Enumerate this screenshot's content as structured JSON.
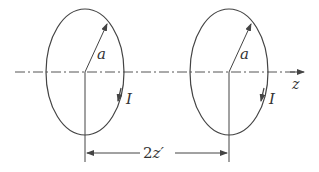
{
  "diagram": {
    "type": "coaxial current loops",
    "loops": [
      {
        "id": "left",
        "radius_label": "a",
        "current_label": "I"
      },
      {
        "id": "right",
        "radius_label": "a",
        "current_label": "I"
      }
    ],
    "axis_label": "z",
    "separation_label": "2z′",
    "separation_prefix": "2",
    "separation_var": "z′",
    "colors": {
      "stroke": "#444444",
      "text": "#333333",
      "background": "#ffffff"
    }
  }
}
